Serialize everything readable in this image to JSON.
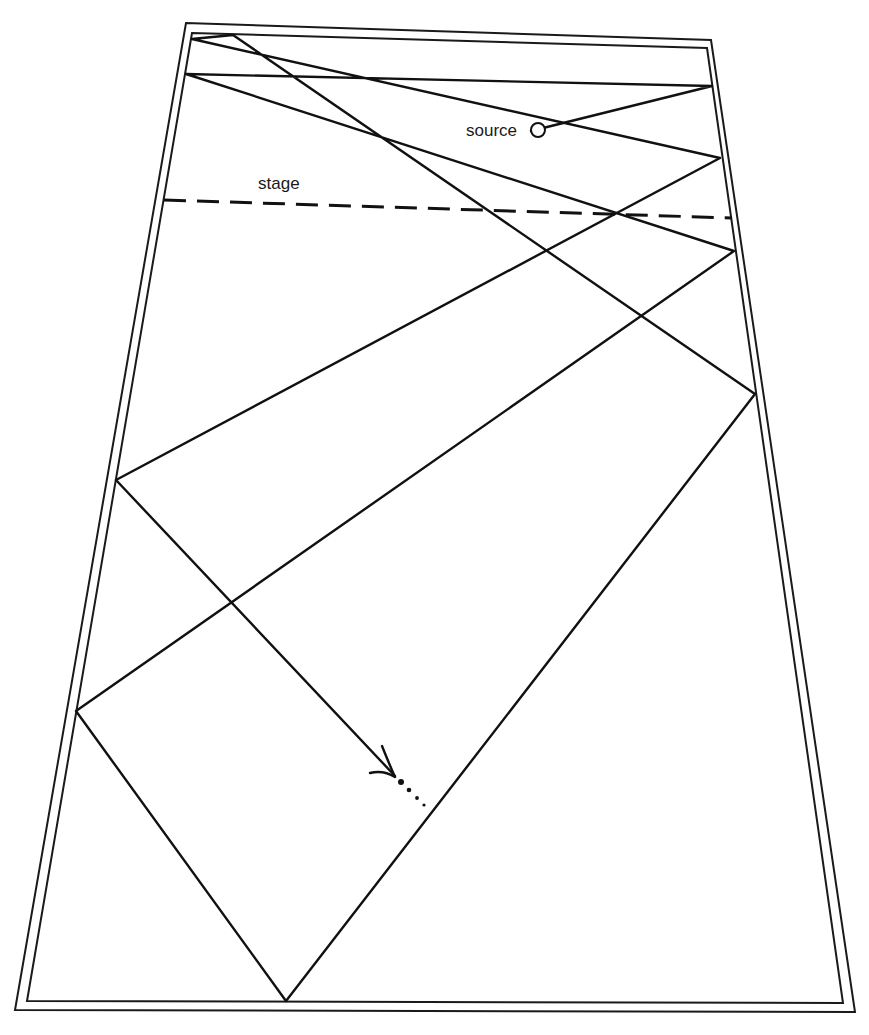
{
  "diagram": {
    "type": "acoustic ray reflection in hall (plan view)",
    "labels": {
      "source": "source",
      "stage": "stage"
    },
    "colors": {
      "line": "#111111",
      "background": "#ffffff"
    },
    "room": {
      "outer_wall": [
        [
          186,
          23
        ],
        [
          711,
          40
        ],
        [
          855,
          1012
        ],
        [
          15,
          1010
        ]
      ],
      "inner_wall": [
        [
          192,
          33
        ],
        [
          707,
          48
        ],
        [
          843,
          1003
        ],
        [
          27,
          1001
        ]
      ]
    },
    "stage_line": {
      "from": [
        164,
        200
      ],
      "to": [
        732,
        218
      ],
      "style": "dashed"
    },
    "source_point": {
      "x": 538,
      "y": 130,
      "r": 7
    },
    "ray_path": [
      [
        531,
        131
      ],
      [
        712,
        86
      ],
      [
        186,
        74
      ],
      [
        734,
        251
      ],
      [
        76,
        711
      ],
      [
        286,
        1001
      ],
      [
        755,
        394
      ],
      [
        233,
        35
      ],
      [
        192,
        39
      ],
      [
        720,
        158
      ],
      [
        116,
        480
      ],
      [
        395,
        776
      ]
    ],
    "continuation_dots": [
      [
        401,
        782
      ],
      [
        409,
        790
      ],
      [
        417,
        798
      ],
      [
        424,
        805
      ]
    ]
  }
}
